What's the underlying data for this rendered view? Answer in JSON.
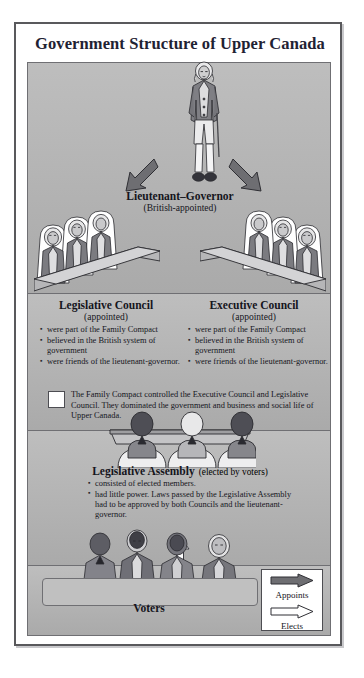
{
  "poster": {
    "title": "Government Structure of Upper Canada"
  },
  "governor": {
    "name": "Lieutenant–Governor",
    "appointment": "(British-appointed)",
    "figure_icon": "lieutenant-governor-figure-icon"
  },
  "arrows": {
    "appoint_left_icon": "appoints-arrow-down-left-icon",
    "appoint_right_icon": "appoints-arrow-down-right-icon",
    "elect_up_icon": "elects-arrow-up-icon"
  },
  "councils": [
    {
      "id": "legislative-council",
      "title": "Legislative Council",
      "subtitle": "(appointed)",
      "figures_icon": "legislative-council-members-icon",
      "bullets": [
        "were part of the Family Compact",
        "believed in the British system of government",
        "were friends of the lieutenant-governor."
      ]
    },
    {
      "id": "executive-council",
      "title": "Executive Council",
      "subtitle": "(appointed)",
      "figures_icon": "executive-council-members-icon",
      "bullets": [
        "were part of the Family Compact",
        "believed in the British system of government",
        "were friends of the lieutenant-governor."
      ]
    }
  ],
  "family_compact_note": {
    "swatch_icon": "family-compact-swatch-icon",
    "text": "The Family Compact controlled the Executive Council and Legislative Council. They dominated the government and business and social life of Upper Canada."
  },
  "assembly": {
    "title": "Legislative Assembly",
    "subtitle": "(elected by voters)",
    "figures_icon": "legislative-assembly-members-icon",
    "bullets": [
      "consisted of elected members.",
      "had little power. Laws passed by the Legislative Assembly had to be approved by both Councils and the lieutenant-governor."
    ]
  },
  "voters": {
    "label": "Voters",
    "figures_icon": "voters-crowd-icon"
  },
  "legend": {
    "items": [
      {
        "label": "Appoints",
        "icon": "filled-arrow-right-icon",
        "style": "filled"
      },
      {
        "label": "Elects",
        "icon": "hollow-arrow-right-icon",
        "style": "hollow"
      }
    ]
  },
  "colors": {
    "panel": "#b3b3b3",
    "frame": "#59595c",
    "title": "#1f2233",
    "arrow_fill": "#6e6e72",
    "arrow_hollow": "#ffffff"
  }
}
